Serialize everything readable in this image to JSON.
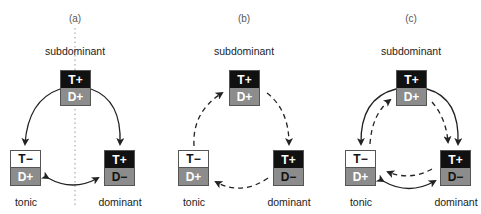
{
  "panels": [
    {
      "label": "(a)",
      "top_role": "subdominant",
      "left_role": "tonic",
      "right_role": "dominant",
      "top_box": {
        "upper": "T+",
        "lower": "D+"
      },
      "left_box": {
        "upper": "T−",
        "lower": "D+"
      },
      "right_box": {
        "upper": "T+",
        "lower": "D−"
      },
      "arrows": "solid: subdominant→tonic, subdominant→dominant, tonic↔dominant; dotted vertical axis"
    },
    {
      "label": "(b)",
      "top_role": "subdominant",
      "left_role": "tonic",
      "right_role": "dominant",
      "top_box": {
        "upper": "T+",
        "lower": "D+"
      },
      "left_box": {
        "upper": "T−",
        "lower": "D+"
      },
      "right_box": {
        "upper": "T+",
        "lower": "D−"
      },
      "arrows": "dashed cycle: tonic→subdominant→dominant→tonic"
    },
    {
      "label": "(c)",
      "top_role": "subdominant",
      "left_role": "tonic",
      "right_role": "dominant",
      "top_box": {
        "upper": "T+",
        "lower": "D+"
      },
      "left_box": {
        "upper": "T−",
        "lower": "D+"
      },
      "right_box": {
        "upper": "T+",
        "lower": "D−"
      },
      "arrows": "combined solid arrows of (a) and dashed cycle of (b)"
    }
  ],
  "colors": {
    "black": "#111111",
    "gray": "#8c8c8c",
    "white": "#ffffff",
    "line": "#222222"
  }
}
